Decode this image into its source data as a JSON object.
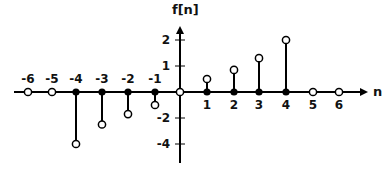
{
  "chart_data": {
    "type": "stem",
    "title": "",
    "xlabel": "n",
    "ylabel": "f[n]",
    "x": [
      -6,
      -5,
      -4,
      -3,
      -2,
      -1,
      0,
      1,
      2,
      3,
      4,
      5,
      6
    ],
    "values": [
      0,
      0,
      -4,
      -2.5,
      -1.7,
      -1,
      0,
      0.5,
      0.85,
      1.3,
      2,
      0,
      0
    ],
    "x_tick_labels": [
      "-6",
      "-5",
      "-4",
      "-3",
      "-2",
      "-1",
      "1",
      "2",
      "3",
      "4",
      "5",
      "6"
    ],
    "y_ticks": [
      2,
      1,
      -2,
      -4
    ],
    "y_tick_labels": [
      "2",
      "1",
      "-2",
      "-4"
    ],
    "xlim": [
      -6.5,
      7
    ],
    "ylim": [
      -5,
      2.5
    ],
    "grid": false,
    "legend": null,
    "marker_style": "open circle at tip, filled dot at base for nonzero samples; open circle on axis for zero samples"
  },
  "axes": {
    "x_label": "n",
    "y_label": "f[n]"
  }
}
